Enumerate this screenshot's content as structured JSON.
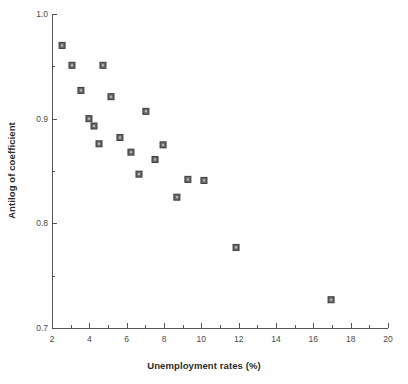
{
  "chart_data": {
    "type": "scatter",
    "title": "",
    "xlabel": "Unemployment rates (%)",
    "ylabel": "Antilog of coefficient",
    "xlim": [
      2,
      20
    ],
    "ylim": [
      0.7,
      1.0
    ],
    "xticks": [
      2,
      4,
      6,
      8,
      10,
      12,
      14,
      16,
      18,
      20
    ],
    "xtick_labels": [
      "2",
      "4",
      "6",
      "8",
      "10",
      "12",
      "14",
      "16",
      "18",
      "20"
    ],
    "x_minor_tick_step": 1,
    "yticks": [
      0.7,
      0.8,
      0.9,
      1.0
    ],
    "ytick_labels": [
      "0.7",
      "0.8",
      "0.9",
      "1.0"
    ],
    "y_minor_ticks": [
      0.75,
      0.85,
      0.95
    ],
    "grid": false,
    "legend": false,
    "marker": {
      "shape": "square",
      "face_color": "#6b6b6b",
      "edge_color": "#3c3c3c",
      "size_px": 6
    },
    "axis_color": "#555555",
    "background_color": "#ffffff",
    "points": [
      {
        "x": 2.54,
        "y": 0.97
      },
      {
        "x": 3.07,
        "y": 0.951
      },
      {
        "x": 4.73,
        "y": 0.951
      },
      {
        "x": 3.55,
        "y": 0.927
      },
      {
        "x": 5.16,
        "y": 0.921
      },
      {
        "x": 3.98,
        "y": 0.9
      },
      {
        "x": 4.25,
        "y": 0.893
      },
      {
        "x": 4.52,
        "y": 0.876
      },
      {
        "x": 7.03,
        "y": 0.907
      },
      {
        "x": 5.64,
        "y": 0.882
      },
      {
        "x": 6.23,
        "y": 0.868
      },
      {
        "x": 7.95,
        "y": 0.875
      },
      {
        "x": 7.52,
        "y": 0.861
      },
      {
        "x": 6.66,
        "y": 0.847
      },
      {
        "x": 9.28,
        "y": 0.842
      },
      {
        "x": 10.14,
        "y": 0.841
      },
      {
        "x": 8.69,
        "y": 0.825
      },
      {
        "x": 11.86,
        "y": 0.777
      },
      {
        "x": 16.95,
        "y": 0.727
      }
    ]
  }
}
